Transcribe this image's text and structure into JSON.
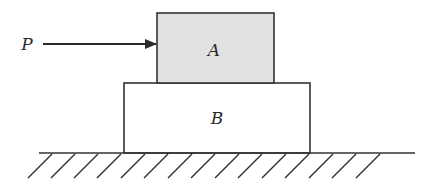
{
  "diagram": {
    "force": {
      "label": "P",
      "direction": "right"
    },
    "blocks": [
      {
        "id": "A",
        "label": "A",
        "fill": "#e2e2e2",
        "position": "top"
      },
      {
        "id": "B",
        "label": "B",
        "fill": "#ffffff",
        "position": "bottom"
      }
    ],
    "ground": {
      "type": "hatched-surface"
    },
    "colors": {
      "stroke": "#333333",
      "block_a_fill": "#e2e2e2",
      "background": "#ffffff"
    }
  }
}
